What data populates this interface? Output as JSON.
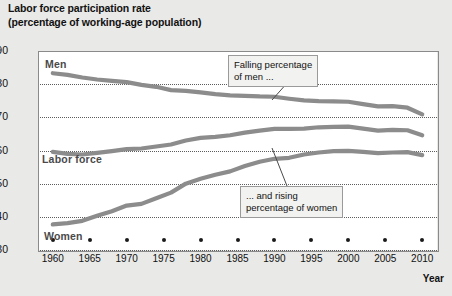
{
  "title": {
    "line1": "Labor force participation rate",
    "line2": "(percentage of working-age population)"
  },
  "axes": {
    "y_ticks": [
      "90",
      "80",
      "70",
      "60",
      "50",
      "40",
      "30"
    ],
    "x_ticks": [
      "1960",
      "1965",
      "1970",
      "1975",
      "1980",
      "1985",
      "1990",
      "1995",
      "2000",
      "2005",
      "2010"
    ],
    "x_title": "Year"
  },
  "series_labels": {
    "men": "Men",
    "labor_force": "Labor force",
    "women": "Women"
  },
  "annotations": {
    "men_note_line1": "Falling percentage",
    "men_note_line2": "of men ...",
    "women_note_line1": "... and rising",
    "women_note_line2": "percentage of women"
  },
  "colors": {
    "line": "#8c8c8c",
    "grid": "#5c5c5c",
    "frame": "#8a8a8a",
    "plot_background": "#ffffff",
    "page_background": "#e9e9e7",
    "label_text": "#4a4a4a"
  },
  "chart_data": {
    "type": "line",
    "title": "Labor force participation rate (percentage of working-age population)",
    "xlabel": "Year",
    "ylabel": "",
    "xlim": [
      1958,
      2012
    ],
    "ylim": [
      30,
      90
    ],
    "y_tick_values": [
      30,
      40,
      50,
      60,
      70,
      80,
      90
    ],
    "x_tick_values": [
      1960,
      1965,
      1970,
      1975,
      1980,
      1985,
      1990,
      1995,
      2000,
      2005,
      2010
    ],
    "grid": "horizontal-dotted",
    "legend": "inline-labels",
    "x": [
      1960,
      1962,
      1964,
      1966,
      1968,
      1970,
      1972,
      1974,
      1976,
      1978,
      1980,
      1982,
      1984,
      1986,
      1988,
      1990,
      1992,
      1994,
      1996,
      1998,
      2000,
      2002,
      2004,
      2006,
      2008,
      2010
    ],
    "series": [
      {
        "name": "Men",
        "values": [
          83.3,
          82.8,
          82.0,
          81.4,
          81.0,
          80.6,
          79.8,
          79.2,
          78.2,
          78.0,
          77.5,
          77.0,
          76.6,
          76.5,
          76.3,
          76.2,
          75.6,
          75.1,
          74.9,
          74.8,
          74.7,
          74.0,
          73.3,
          73.4,
          72.9,
          70.9
        ]
      },
      {
        "name": "Labor force",
        "values": [
          59.6,
          59.0,
          58.8,
          59.3,
          59.8,
          60.4,
          60.6,
          61.2,
          61.8,
          63.0,
          63.8,
          64.1,
          64.6,
          65.4,
          66.0,
          66.5,
          66.5,
          66.6,
          67.0,
          67.1,
          67.2,
          66.6,
          66.0,
          66.2,
          66.1,
          64.6
        ]
      },
      {
        "name": "Women",
        "values": [
          37.7,
          38.1,
          38.8,
          40.3,
          41.7,
          43.4,
          43.9,
          45.6,
          47.3,
          50.0,
          51.5,
          52.7,
          53.7,
          55.3,
          56.6,
          57.5,
          57.8,
          58.8,
          59.4,
          59.8,
          59.9,
          59.6,
          59.2,
          59.4,
          59.5,
          58.6
        ]
      }
    ],
    "annotations": [
      {
        "text": "Falling percentage of men ...",
        "points_to_series": "Men",
        "points_to_x": 1990
      },
      {
        "text": "... and rising percentage of women",
        "points_to_series": "Women",
        "points_to_x": 1990
      }
    ]
  }
}
